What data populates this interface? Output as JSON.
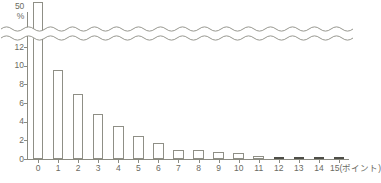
{
  "chart_data": {
    "type": "bar",
    "title": "",
    "subtitle": "",
    "xlabel": "15(ポイント)",
    "ylabel": "%",
    "axis_top_label": "50",
    "axis_top_unit": "%",
    "categories": [
      "0",
      "1",
      "2",
      "3",
      "4",
      "5",
      "6",
      "7",
      "8",
      "9",
      "10",
      "11",
      "12",
      "13",
      "14",
      "15"
    ],
    "values": [
      50,
      10.8,
      8.3,
      6.1,
      4.8,
      3.8,
      3.0,
      2.3,
      2.2,
      2.0,
      1.9,
      1.6,
      1.5,
      1.3,
      1.1,
      1.4
    ],
    "x_tick_labels": [
      "0",
      "1",
      "2",
      "3",
      "4",
      "5",
      "6",
      "7",
      "8",
      "9",
      "10",
      "11",
      "12",
      "13",
      "14",
      "15(ポイント)"
    ],
    "y_tick_labels": [
      "0",
      "2",
      "4",
      "6",
      "8",
      "10",
      "12"
    ],
    "y_tick_values": [
      0,
      2,
      4,
      6,
      8,
      10,
      12
    ],
    "ylim": [
      0,
      12
    ],
    "axis_break": true,
    "axis_break_style": "wavy",
    "grid": false,
    "legend": null,
    "bar_fill_default": "#ffffff",
    "bar_stroke_default": "#8f8f86",
    "bar_fill_highlight": "#5c5c54",
    "highlighted_categories": [
      "12",
      "13",
      "14",
      "15"
    ],
    "truncated_bars": [
      "0"
    ],
    "axis_color": "#8b8b82",
    "text_color": "#6b6b63",
    "background": "#ffffff"
  }
}
